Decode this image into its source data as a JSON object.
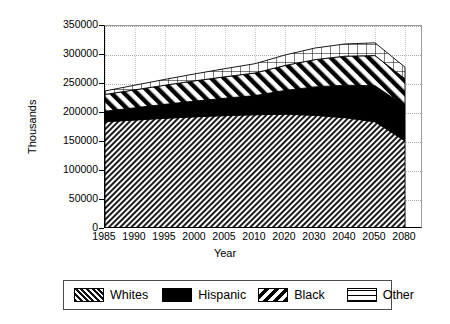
{
  "chart_data": {
    "type": "area",
    "stacked": true,
    "title": "",
    "xlabel": "Year",
    "ylabel": "Thousands",
    "ylim": [
      0,
      350000
    ],
    "yticks": [
      0,
      50000,
      100000,
      150000,
      200000,
      250000,
      300000,
      350000
    ],
    "ytick_labels": [
      "0",
      "50000",
      "100000",
      "150000",
      "200000",
      "250000",
      "300000",
      "350000"
    ],
    "grid": true,
    "legend_position": "bottom",
    "categories": [
      1985,
      1990,
      1995,
      2000,
      2005,
      2010,
      2020,
      2030,
      2040,
      2050,
      2080
    ],
    "xtick_labels": [
      "1985",
      "1990",
      "1995",
      "2000",
      "2005",
      "2010",
      "2020",
      "2030",
      "2040",
      "2050",
      "2080"
    ],
    "series": [
      {
        "name": "Whites",
        "pattern": "dense-diagonal-hatch",
        "color": "#808080",
        "values": [
          185000,
          188000,
          191000,
          193500,
          195500,
          197000,
          198000,
          196000,
          192000,
          185000,
          152000
        ]
      },
      {
        "name": "Hispanic",
        "pattern": "solid-black",
        "color": "#000000",
        "values": [
          18000,
          21000,
          24000,
          27000,
          30000,
          33000,
          41000,
          49000,
          56000,
          62000,
          60000
        ]
      },
      {
        "name": "Black",
        "pattern": "wide-diagonal-hatch",
        "color": "#ffffff",
        "values": [
          29000,
          31000,
          33000,
          35000,
          37000,
          39000,
          43000,
          47000,
          50000,
          52000,
          47000
        ]
      },
      {
        "name": "Other",
        "pattern": "crosshatch-grid",
        "color": "#ffffff",
        "values": [
          6000,
          8000,
          10000,
          12000,
          14000,
          16000,
          18000,
          20000,
          21000,
          22000,
          20000
        ]
      }
    ],
    "totals": [
      238000,
      248000,
      258000,
      267500,
      276500,
      285000,
      300000,
      312000,
      319000,
      321000,
      279000
    ]
  },
  "axes": {
    "ylabel": "Thousands",
    "xlabel": "Year"
  },
  "legend": {
    "items": [
      {
        "label": "Whites",
        "swatch": "dense-diagonal-hatch"
      },
      {
        "label": "Hispanic",
        "swatch": "solid-black"
      },
      {
        "label": "Black",
        "swatch": "wide-diagonal-hatch"
      },
      {
        "label": "Other",
        "swatch": "crosshatch-grid"
      }
    ]
  }
}
